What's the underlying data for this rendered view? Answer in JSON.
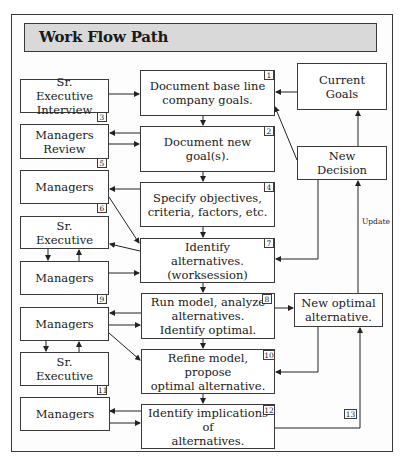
{
  "title": "Work Flow Path",
  "boxes": {
    "sr_exec_interview": "Sr. Executive\nInterview",
    "managers_review": "Managers\nReview",
    "managers_5": "Managers",
    "sr_exec_6": "Sr. Executive",
    "managers_6b": "Managers",
    "managers_9": "Managers",
    "sr_exec_9b": "Sr. Executive",
    "managers_11": "Managers",
    "doc_baseline": "Document base line\ncompany goals.",
    "doc_new_goals": "Document new goal(s).",
    "specify_objectives": "Specify objectives,\ncriteria, factors, etc.",
    "identify_alternatives": "Identify alternatives.\n(worksession)",
    "run_model": "Run model, analyze\nalternatives.\nIdentify optimal.",
    "refine_model": "Refine model, propose\noptimal alternative.",
    "identify_implications": "Identify implications of\nalternatives.",
    "current_goals": "Current Goals",
    "new_decision": "New Decision",
    "new_optimal": "New optimal\nalternative."
  },
  "step_numbers": {
    "n1": "1",
    "n2": "2",
    "n3": "3",
    "n4": "4",
    "n5": "5",
    "n6": "6",
    "n7": "7",
    "n8": "8",
    "n9": "9",
    "n10": "10",
    "n11": "11",
    "n12": "12",
    "n13": "13"
  },
  "labels": {
    "update": "Update"
  }
}
